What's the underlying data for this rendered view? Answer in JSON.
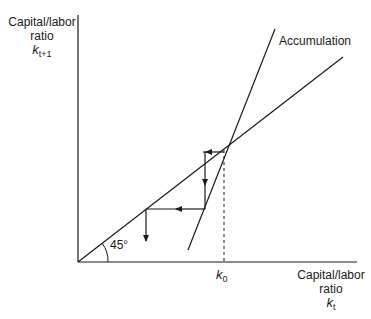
{
  "diagram": {
    "y_axis_label": {
      "line1": "Capital/labor",
      "line2": "ratio",
      "var": "k",
      "sub": "t+1"
    },
    "x_axis_label": {
      "line1": "Capital/labor",
      "line2": "ratio",
      "var": "k",
      "sub": "t"
    },
    "curve_label": "Accumulation",
    "angle_label": "45°",
    "k0_label": {
      "var": "k",
      "sub": "0"
    },
    "colors": {
      "line": "#1a1a1a",
      "background": "#ffffff"
    }
  }
}
